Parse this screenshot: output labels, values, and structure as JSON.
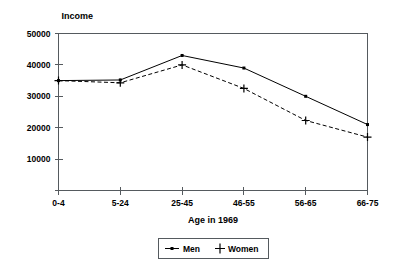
{
  "chart_data": {
    "type": "line",
    "title": "",
    "ylabel": "Income",
    "xlabel": "Age in 1969",
    "categories": [
      "0-4",
      "5-24",
      "25-45",
      "46-55",
      "56-65",
      "66-75"
    ],
    "yticks": [
      0,
      10000,
      20000,
      30000,
      40000,
      50000
    ],
    "ytick_labels": [
      "",
      "10000",
      "20000",
      "30000",
      "40000",
      "50000"
    ],
    "ylim": [
      0,
      50000
    ],
    "grid": false,
    "legend_position": "bottom-center",
    "series": [
      {
        "name": "Men",
        "marker": "dot",
        "linestyle": "solid",
        "color": "#000000",
        "values": [
          35000,
          35200,
          43000,
          39000,
          30000,
          21000
        ]
      },
      {
        "name": "Women",
        "marker": "plus",
        "linestyle": "dashed",
        "color": "#000000",
        "values": [
          35000,
          34300,
          40000,
          32500,
          22300,
          17000
        ]
      }
    ]
  },
  "legend": {
    "items": [
      {
        "label": "Men"
      },
      {
        "label": "Women"
      }
    ]
  },
  "colors": {
    "ink": "#000000",
    "frame": "#555a5e",
    "background": "#ffffff"
  }
}
